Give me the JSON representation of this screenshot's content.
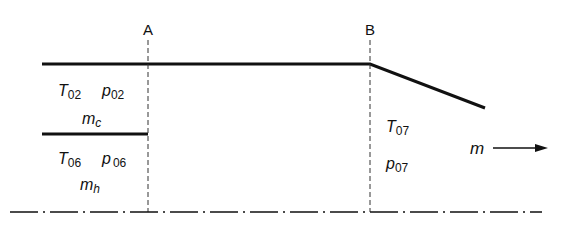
{
  "diagram": {
    "section_labels": {
      "a": "A",
      "b": "B"
    },
    "upstream_cold": {
      "temperature": {
        "base": "T",
        "sub": "02"
      },
      "pressure": {
        "base": "p",
        "sub": "02"
      },
      "mass_flow": {
        "base": "m",
        "sub": "c"
      }
    },
    "upstream_hot": {
      "temperature": {
        "base": "T",
        "sub": "06"
      },
      "pressure": {
        "base": "p",
        "sub": "06"
      },
      "mass_flow": {
        "base": "m",
        "sub": "h"
      }
    },
    "downstream": {
      "temperature": {
        "base": "T",
        "sub": "07"
      },
      "pressure": {
        "base": "p",
        "sub": "07"
      }
    },
    "flow_direction": {
      "label": "m",
      "arrow": "right-arrow"
    },
    "colors": {
      "line": "#111111",
      "background": "#ffffff"
    }
  }
}
